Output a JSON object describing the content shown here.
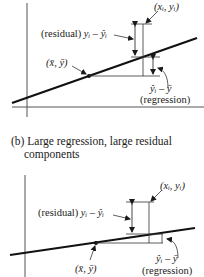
{
  "caption": {
    "label": "(b)",
    "line1": "Large regression, large residual",
    "line2": "components"
  },
  "diagrams": [
    {
      "id": "top",
      "labels": {
        "point": "(xᵢ, yᵢ)",
        "point_x": "x",
        "point_y": "y",
        "subscript": "i",
        "residual_prefix": "(residual)",
        "residual_expr": "yᵢ – ŷᵢ",
        "mean": "(x̄, ȳ)",
        "regression_expr": "ŷᵢ – ȳ",
        "regression_label": "(regression)"
      }
    },
    {
      "id": "bottom",
      "labels": {
        "point": "(xᵢ, yᵢ)",
        "residual_prefix": "(residual)",
        "residual_expr": "yᵢ – ŷᵢ",
        "mean": "(x̄, ȳ)",
        "regression_expr": "ŷᵢ – ȳ",
        "regression_label": "(regression)"
      }
    }
  ],
  "colors": {
    "ink": "#1a1a1a",
    "axis": "#555555",
    "background": "#ffffff"
  }
}
